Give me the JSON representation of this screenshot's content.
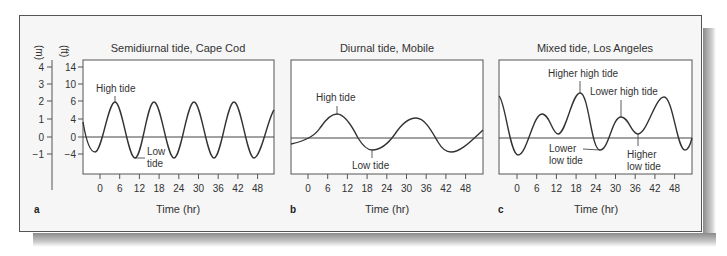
{
  "figure": {
    "y_axis": {
      "m_label": "(m)",
      "ft_label": "(ft)",
      "m_ticks": [
        "4",
        "3",
        "2",
        "1",
        "0",
        "−1"
      ],
      "ft_ticks": [
        "14",
        "10",
        "6",
        "4",
        "0",
        "−4"
      ]
    },
    "panels": [
      {
        "letter": "a",
        "title": "Semidiurnal tide, Cape Cod",
        "xlabel": "Time (hr)",
        "annotations": {
          "high": "High tide",
          "low_1": "Low",
          "low_2": "tide"
        }
      },
      {
        "letter": "b",
        "title": "Diurnal tide, Mobile",
        "xlabel": "Time (hr)",
        "annotations": {
          "high": "High tide",
          "low": "Low tide"
        }
      },
      {
        "letter": "c",
        "title": "Mixed tide, Los Angeles",
        "xlabel": "Time (hr)",
        "annotations": {
          "higher_high": "Higher high tide",
          "lower_high": "Lower high tide",
          "lower_low_1": "Lower",
          "lower_low_2": "low tide",
          "higher_low_1": "Higher",
          "higher_low_2": "low tide"
        }
      }
    ],
    "x_ticks": [
      "0",
      "6",
      "12",
      "18",
      "24",
      "30",
      "36",
      "42",
      "48"
    ]
  },
  "chart_data": [
    {
      "type": "line",
      "title": "Semidiurnal tide, Cape Cod",
      "xlabel": "Time (hr)",
      "ylabel": "(m) / (ft)",
      "x_ticks": [
        0,
        6,
        12,
        18,
        24,
        30,
        36,
        42,
        48
      ],
      "y_ticks_m": [
        4,
        3,
        2,
        1,
        0,
        -1
      ],
      "y_ticks_ft": [
        14,
        10,
        6,
        4,
        0,
        -4
      ],
      "series": [
        {
          "name": "Tide height (m)",
          "x": [
            -5,
            -2,
            4,
            10,
            16,
            22,
            28,
            34,
            40,
            46,
            52
          ],
          "values": [
            0.5,
            -0.9,
            2.0,
            -1.3,
            2.0,
            -1.3,
            2.0,
            -1.3,
            2.0,
            -1.3,
            1.2
          ]
        }
      ],
      "annotations": [
        "High tide",
        "Low tide"
      ]
    },
    {
      "type": "line",
      "title": "Diurnal tide, Mobile",
      "xlabel": "Time (hr)",
      "x_ticks": [
        0,
        6,
        12,
        18,
        24,
        30,
        36,
        42,
        48
      ],
      "series": [
        {
          "name": "Tide height (m)",
          "x": [
            -5,
            9,
            20,
            33,
            43,
            53
          ],
          "values": [
            -0.3,
            1.3,
            -0.6,
            1.0,
            -0.7,
            0.4
          ]
        }
      ],
      "annotations": [
        "High tide",
        "Low tide"
      ]
    },
    {
      "type": "line",
      "title": "Mixed tide, Los Angeles",
      "xlabel": "Time (hr)",
      "x_ticks": [
        0,
        6,
        12,
        18,
        24,
        30,
        36,
        42,
        48
      ],
      "series": [
        {
          "name": "Tide height (m)",
          "x": [
            -5,
            0,
            7,
            13,
            19,
            26,
            32,
            37,
            45,
            51,
            53
          ],
          "values": [
            2.2,
            -0.9,
            1.2,
            0.2,
            2.3,
            -0.6,
            1.1,
            0.2,
            2.1,
            -0.6,
            0
          ]
        }
      ],
      "annotations": [
        "Higher high tide",
        "Lower high tide",
        "Lower low tide",
        "Higher low tide"
      ]
    }
  ]
}
